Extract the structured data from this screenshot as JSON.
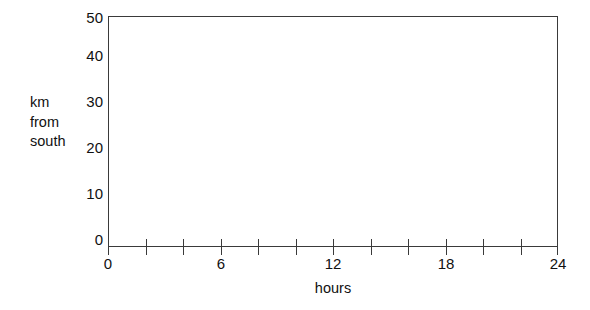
{
  "chart_data": {
    "type": "line",
    "title": "",
    "subtitle": "",
    "xlabel": "hours",
    "ylabel": "km from south",
    "ylabel_lines": [
      "km",
      "from",
      "south"
    ],
    "xlim": [
      0,
      24
    ],
    "ylim": [
      0,
      50
    ],
    "x_major_ticks": [
      0,
      6,
      12,
      18,
      24
    ],
    "x_minor_ticks": [
      2,
      4,
      8,
      10,
      14,
      16,
      20,
      22
    ],
    "x_all_ticks": [
      0,
      2,
      4,
      6,
      8,
      10,
      12,
      14,
      16,
      18,
      20,
      22,
      24
    ],
    "x_tick_labels": [
      "0",
      "6",
      "12",
      "18",
      "24"
    ],
    "y_major_ticks": [
      0,
      10,
      20,
      30,
      40,
      50
    ],
    "y_tick_labels": [
      "0",
      "10",
      "20",
      "30",
      "40",
      "50"
    ],
    "grid": false,
    "legend": null,
    "series": [],
    "values": [],
    "annotations": [],
    "note": "Empty axes template: no data series are plotted inside the frame.",
    "colors": {
      "axis": "#3a3a3a",
      "text": "#111111",
      "background": "#ffffff"
    }
  }
}
